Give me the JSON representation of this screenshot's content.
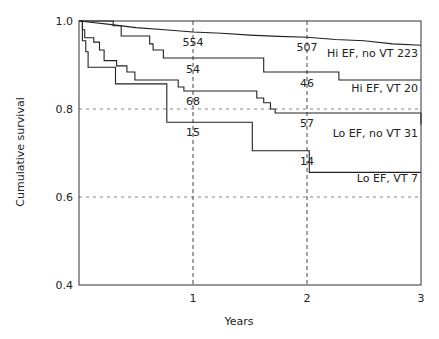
{
  "chart_data": {
    "type": "line",
    "subtype": "kaplan-meier step",
    "title": "",
    "xlabel": "Years",
    "ylabel": "Cumulative survival",
    "xlim": [
      0,
      3
    ],
    "ylim": [
      0.4,
      1.0
    ],
    "xticks": [
      1,
      2,
      3
    ],
    "xtick_labels": [
      "1",
      "2",
      "3"
    ],
    "yticks": [
      0.4,
      0.6,
      0.8,
      1.0
    ],
    "ytick_labels": [
      "0.4",
      "0.6",
      "0.8",
      "1.0"
    ],
    "grid": {
      "dashed_x": [
        1,
        2
      ],
      "dashed_y": [
        0.6,
        0.8
      ]
    },
    "series": [
      {
        "name": "Hi EF, no VT",
        "label": "Hi EF, no VT 223",
        "n_at_3yr": 223,
        "points": [
          [
            0,
            1.0
          ],
          [
            0.1,
            0.997
          ],
          [
            0.25,
            0.993
          ],
          [
            0.5,
            0.985
          ],
          [
            0.75,
            0.98
          ],
          [
            1.0,
            0.975
          ],
          [
            1.25,
            0.972
          ],
          [
            1.5,
            0.968
          ],
          [
            1.75,
            0.965
          ],
          [
            2.0,
            0.963
          ],
          [
            2.25,
            0.958
          ],
          [
            2.5,
            0.955
          ],
          [
            2.75,
            0.948
          ],
          [
            3.0,
            0.945
          ]
        ],
        "at_risk": [
          {
            "x": 1,
            "n": 554
          },
          {
            "x": 2,
            "n": 507
          }
        ]
      },
      {
        "name": "Hi EF, VT",
        "label": "Hi EF, VT 20",
        "n_at_3yr": 20,
        "points": [
          [
            0,
            1.0
          ],
          [
            0.3,
            1.0
          ],
          [
            0.3,
            0.989
          ],
          [
            0.37,
            0.989
          ],
          [
            0.37,
            0.966
          ],
          [
            0.62,
            0.966
          ],
          [
            0.62,
            0.948
          ],
          [
            0.65,
            0.948
          ],
          [
            0.65,
            0.934
          ],
          [
            0.74,
            0.934
          ],
          [
            0.74,
            0.916
          ],
          [
            1.62,
            0.916
          ],
          [
            1.62,
            0.884
          ],
          [
            2.28,
            0.884
          ],
          [
            2.28,
            0.866
          ],
          [
            3.0,
            0.866
          ]
        ],
        "at_risk": [
          {
            "x": 1,
            "n": 54
          },
          {
            "x": 2,
            "n": 46
          }
        ]
      },
      {
        "name": "Lo EF, no VT",
        "label": "Lo EF, no VT 31",
        "n_at_3yr": 31,
        "points": [
          [
            0,
            1.0
          ],
          [
            0.03,
            1.0
          ],
          [
            0.03,
            0.98
          ],
          [
            0.05,
            0.98
          ],
          [
            0.05,
            0.962
          ],
          [
            0.13,
            0.962
          ],
          [
            0.13,
            0.952
          ],
          [
            0.18,
            0.952
          ],
          [
            0.18,
            0.934
          ],
          [
            0.22,
            0.934
          ],
          [
            0.22,
            0.91
          ],
          [
            0.33,
            0.91
          ],
          [
            0.33,
            0.898
          ],
          [
            0.42,
            0.898
          ],
          [
            0.42,
            0.884
          ],
          [
            0.49,
            0.884
          ],
          [
            0.49,
            0.866
          ],
          [
            0.87,
            0.866
          ],
          [
            0.87,
            0.85
          ],
          [
            0.92,
            0.85
          ],
          [
            0.92,
            0.841
          ],
          [
            1.56,
            0.841
          ],
          [
            1.56,
            0.825
          ],
          [
            1.62,
            0.825
          ],
          [
            1.62,
            0.814
          ],
          [
            1.68,
            0.814
          ],
          [
            1.68,
            0.8
          ],
          [
            1.72,
            0.8
          ],
          [
            1.72,
            0.791
          ],
          [
            3.0,
            0.791
          ],
          [
            3.0,
            0.765
          ]
        ],
        "at_risk": [
          {
            "x": 1,
            "n": 68
          },
          {
            "x": 2,
            "n": 57
          }
        ]
      },
      {
        "name": "Lo EF, VT",
        "label": "Lo EF, VT 7",
        "n_at_3yr": 7,
        "points": [
          [
            0,
            1.0
          ],
          [
            0.03,
            1.0
          ],
          [
            0.03,
            0.955
          ],
          [
            0.06,
            0.955
          ],
          [
            0.06,
            0.93
          ],
          [
            0.08,
            0.93
          ],
          [
            0.08,
            0.895
          ],
          [
            0.32,
            0.895
          ],
          [
            0.32,
            0.857
          ],
          [
            0.77,
            0.857
          ],
          [
            0.77,
            0.77
          ],
          [
            1.52,
            0.77
          ],
          [
            1.52,
            0.705
          ],
          [
            2.02,
            0.705
          ],
          [
            2.02,
            0.656
          ],
          [
            3.0,
            0.656
          ]
        ],
        "at_risk": [
          {
            "x": 1,
            "n": 15
          },
          {
            "x": 2,
            "n": 14
          }
        ]
      }
    ],
    "legend_position": "inline right-side labels"
  }
}
